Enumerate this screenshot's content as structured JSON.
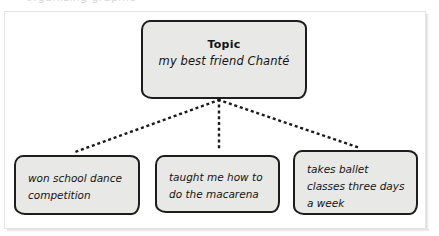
{
  "page": {
    "top_clipped_text": "organizing graphic",
    "background_color": "#ffffff",
    "frame_border_color": "#e4e4e4"
  },
  "diagram": {
    "type": "concept-map",
    "node_fill_color": "#e8e8e6",
    "node_border_color": "#1d1d1d",
    "connector_style": "dotted",
    "connector_color": "#1a1a1a",
    "topic": {
      "title": "Topic",
      "subtitle": "my best friend Chanté"
    },
    "details": [
      {
        "text": "won school dance competition"
      },
      {
        "text": "taught me how to do the macarena"
      },
      {
        "text": "takes ballet classes three days a week"
      }
    ]
  }
}
